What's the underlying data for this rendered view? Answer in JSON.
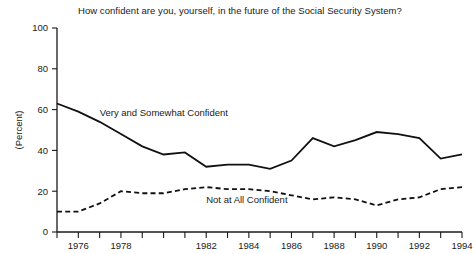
{
  "chart_data": {
    "type": "line",
    "title": "How confident are you, yourself, in the future of the Social Security System?",
    "xlabel": "",
    "ylabel": "(Percent)",
    "ylim": [
      0,
      100
    ],
    "yticks": [
      0,
      20,
      40,
      60,
      80,
      100
    ],
    "ytick_labels": [
      "0",
      "20",
      "40",
      "60",
      "80",
      "100"
    ],
    "xlim": [
      1975,
      1994
    ],
    "xticks": [
      1975,
      1976,
      1977,
      1978,
      1979,
      1980,
      1981,
      1982,
      1983,
      1984,
      1985,
      1986,
      1987,
      1988,
      1989,
      1990,
      1991,
      1992,
      1993,
      1994
    ],
    "xtick_labels_shown": [
      "1976",
      "1978",
      "1982",
      "1984",
      "1986",
      "1988",
      "1990",
      "1992",
      "1994"
    ],
    "xtick_label_years": [
      1976,
      1978,
      1982,
      1984,
      1986,
      1988,
      1990,
      1992,
      1994
    ],
    "grid": false,
    "legend": "inline-labels",
    "x": [
      1975,
      1976,
      1977,
      1978,
      1979,
      1980,
      1981,
      1982,
      1983,
      1984,
      1985,
      1986,
      1987,
      1988,
      1989,
      1990,
      1991,
      1992,
      1993,
      1994
    ],
    "series": [
      {
        "name": "Very and Somewhat Confident",
        "style": "solid",
        "label_x": 1977,
        "label_y": 57,
        "values": [
          63,
          59,
          54,
          48,
          42,
          38,
          39,
          32,
          33,
          33,
          31,
          35,
          46,
          42,
          45,
          49,
          48,
          46,
          36,
          38
        ]
      },
      {
        "name": "Not at All Confident",
        "style": "dashed",
        "label_x": 1982,
        "label_y": 14,
        "values": [
          10,
          10,
          14,
          20,
          19,
          19,
          21,
          22,
          21,
          21,
          20,
          18,
          16,
          17,
          16,
          13,
          16,
          17,
          21,
          22
        ]
      }
    ]
  },
  "axis": {
    "y_title": "(Percent)"
  }
}
